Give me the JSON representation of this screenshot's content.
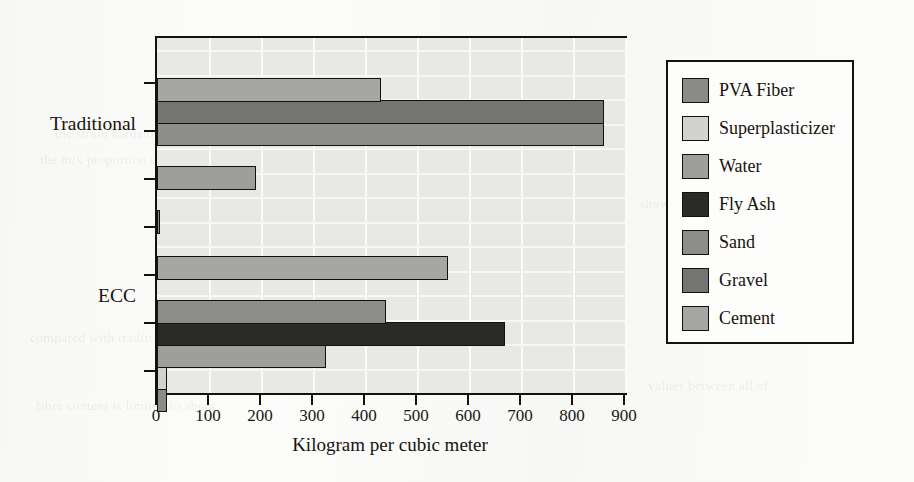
{
  "chart_data": {
    "type": "bar",
    "orientation": "horizontal",
    "title": "",
    "xlabel": "Kilogram per cubic meter",
    "ylabel": "",
    "categories": [
      "ECC",
      "Traditional"
    ],
    "xlim": [
      0,
      900
    ],
    "xticks": [
      0,
      100,
      200,
      300,
      400,
      500,
      600,
      700,
      800,
      900
    ],
    "xtick_labels": [
      "0",
      "100",
      "200",
      "300",
      "400",
      "500",
      "600",
      "700",
      "800",
      "900"
    ],
    "grid": "vertical-and-horizontal-white",
    "legend_position": "right-outside",
    "series": [
      {
        "name": "PVA Fiber",
        "color": "#8a8a88",
        "values": {
          "Traditional": 2,
          "ECC": 20
        }
      },
      {
        "name": "Superplasticizer",
        "color": "#d2d2d0",
        "values": {
          "Traditional": 0,
          "ECC": 20
        }
      },
      {
        "name": "Water",
        "color": "#9e9e9c",
        "values": {
          "Traditional": 190,
          "ECC": 325
        }
      },
      {
        "name": "Fly Ash",
        "color": "#2a2a28",
        "values": {
          "Traditional": 0,
          "ECC": 670
        }
      },
      {
        "name": "Sand",
        "color": "#8d8d8b",
        "values": {
          "Traditional": 860,
          "ECC": 440
        }
      },
      {
        "name": "Gravel",
        "color": "#747472",
        "values": {
          "Traditional": 860,
          "ECC": 0
        }
      },
      {
        "name": "Cement",
        "color": "#a6a6a4",
        "values": {
          "Traditional": 430,
          "ECC": 560
        }
      }
    ]
  },
  "legend": {
    "items": [
      {
        "label": "PVA Fiber",
        "color": "#8a8a88"
      },
      {
        "label": "Superplasticizer",
        "color": "#d2d2d0"
      },
      {
        "label": "Water",
        "color": "#9e9e9c"
      },
      {
        "label": "Fly Ash",
        "color": "#2a2a28"
      },
      {
        "label": "Sand",
        "color": "#8d8d8b"
      },
      {
        "label": "Gravel",
        "color": "#747472"
      },
      {
        "label": "Cement",
        "color": "#a6a6a4"
      }
    ]
  },
  "axis": {
    "x_title": "Kilogram per cubic meter",
    "tick_labels": [
      "0",
      "100",
      "200",
      "300",
      "400",
      "500",
      "600",
      "700",
      "800",
      "900"
    ],
    "category_labels": [
      "Traditional",
      "ECC"
    ]
  },
  "page_background_text": [
    "the strain hardening behaviour",
    "the mix proportion of ECC is",
    "shown in the table below",
    "compared with traditional concrete",
    "values between all of",
    "fibre content is limited to about"
  ]
}
